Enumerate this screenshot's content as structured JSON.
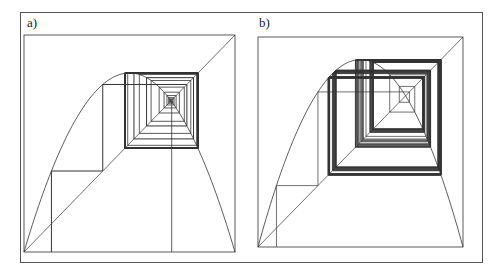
{
  "figure": {
    "panels": [
      {
        "label": "a)",
        "box": {
          "x": 24,
          "y": 35,
          "w": 211,
          "h": 217
        },
        "map": "logistic",
        "r": 3.3,
        "orbits": [
          {
            "x0": 0.13,
            "iterations": 40,
            "stroke_width": 1.0,
            "thick_tail_from": 8
          },
          {
            "x0": 0.7,
            "iterations": 40,
            "stroke_width": 0.8,
            "thick_tail_from": 999
          }
        ]
      },
      {
        "label": "b)",
        "box": {
          "x": 258,
          "y": 37,
          "w": 205,
          "h": 210
        },
        "map": "logistic",
        "r": 3.57,
        "orbits": [
          {
            "x0": 0.09,
            "iterations": 120,
            "stroke_width": 0.7,
            "thick_tail_from": 999
          }
        ]
      }
    ],
    "colors": {
      "line": "#333333",
      "frame": "#555555",
      "background": "#ffffff"
    }
  },
  "chart_data": [
    {
      "type": "line",
      "title": "a) Cobweb diagram of logistic map (period-2 attractor)",
      "xlabel": "",
      "ylabel": "",
      "series": [
        {
          "name": "f(x)=r x (1-x)",
          "r": 3.3
        },
        {
          "name": "y = x"
        }
      ],
      "xlim": [
        0,
        1
      ],
      "ylim": [
        0,
        1
      ],
      "grid": false
    },
    {
      "type": "line",
      "title": "b) Cobweb diagram of logistic map (chaotic regime)",
      "xlabel": "",
      "ylabel": "",
      "series": [
        {
          "name": "f(x)=r x (1-x)",
          "r": 3.57
        },
        {
          "name": "y = x"
        }
      ],
      "xlim": [
        0,
        1
      ],
      "ylim": [
        0,
        1
      ],
      "grid": false
    }
  ]
}
